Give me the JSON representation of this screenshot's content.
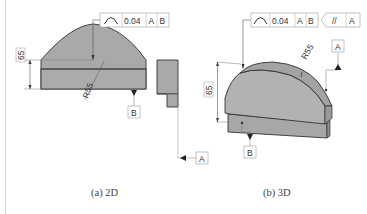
{
  "figure": {
    "panels": [
      {
        "id": "2d",
        "caption": "(a) 2D",
        "fcf": {
          "symbol": "profile-of-a-line",
          "tolerance": "0.04",
          "datums": [
            "A",
            "B"
          ]
        },
        "dimensions": {
          "height": "65",
          "radius": "R55"
        },
        "datum_labels": [
          "B",
          "A"
        ]
      },
      {
        "id": "3d",
        "caption": "(b) 3D",
        "fcf": {
          "symbol": "profile-of-a-line",
          "tolerance": "0.04",
          "datums": [
            "A",
            "B"
          ]
        },
        "fcf2": {
          "symbol": "parallelism",
          "symbol_text": "//",
          "datums": [
            "A"
          ]
        },
        "dimensions": {
          "height": "65",
          "radius": "R55"
        },
        "datum_labels": [
          "A",
          "B"
        ]
      }
    ],
    "colors": {
      "part_fill": "#a9a9a9",
      "part_fill_light": "#bdbdbd",
      "edge": "#333333",
      "leader": "#555555"
    }
  }
}
